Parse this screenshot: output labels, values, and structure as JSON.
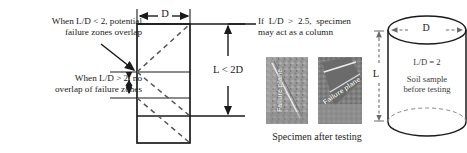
{
  "figure": {
    "background": "#ffffff",
    "line_color": "#1a1a1a",
    "dash_color": "#555555",
    "photo_base": "#8f8f8f"
  },
  "annotations": {
    "overlap_note": "When L/D < 2, potential\nfailure zones overlap",
    "no_overlap_note": "When L/D > 2, no\noverlap of failure zones",
    "column_note": "If  L/D  >  2.5,  specimen\nmay act as a column"
  },
  "box_diagram": {
    "diameter_label": "D",
    "length_label": "L < 2D"
  },
  "photos": {
    "caption": "Specimen after testing",
    "items": [
      {
        "label": "Failure plane"
      },
      {
        "label": "Failure plane"
      }
    ]
  },
  "cylinder": {
    "diameter_label": "D",
    "length_label": "L",
    "ratio_label": "L/D = 2",
    "description": "Soil sample\nbefore testing"
  }
}
